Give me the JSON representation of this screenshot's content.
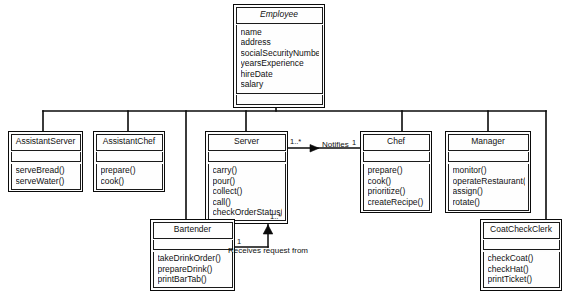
{
  "diagram": {
    "type": "uml-class-diagram",
    "colors": {
      "background": "#ffffff",
      "line": "#0a0a0a",
      "text": "#111111",
      "box_fill": "#fdfdfd"
    }
  },
  "classes": {
    "employee": {
      "name": "Employee",
      "abstract": true,
      "attributes": [
        "name",
        "address",
        "socialSecurityNumber",
        "yearsExperience",
        "hireDate",
        "salary"
      ],
      "methods": []
    },
    "assistant_server": {
      "name": "AssistantServer",
      "abstract": false,
      "attributes": [],
      "methods": [
        "serveBread()",
        "serveWater()"
      ]
    },
    "assistant_chef": {
      "name": "AssistantChef",
      "abstract": false,
      "attributes": [],
      "methods": [
        "prepare()",
        "cook()"
      ]
    },
    "server": {
      "name": "Server",
      "abstract": false,
      "attributes": [],
      "methods": [
        "carry()",
        "pour()",
        "collect()",
        "call()",
        "checkOrderStatus()"
      ]
    },
    "chef": {
      "name": "Chef",
      "abstract": false,
      "attributes": [],
      "methods": [
        "prepare()",
        "cook()",
        "prioritize()",
        "createRecipe()"
      ]
    },
    "manager": {
      "name": "Manager",
      "abstract": false,
      "attributes": [],
      "methods": [
        "monitor()",
        "operateRestaurant()",
        "assign()",
        "rotate()"
      ]
    },
    "bartender": {
      "name": "Bartender",
      "abstract": false,
      "attributes": [],
      "methods": [
        "takeDrinkOrder()",
        "prepareDrink()",
        "printBarTab()"
      ]
    },
    "coat_check_clerk": {
      "name": "CoatCheckClerk",
      "abstract": false,
      "attributes": [],
      "methods": [
        "checkCoat()",
        "checkHat()",
        "printTicket()"
      ]
    }
  },
  "associations": {
    "notifies": {
      "label": "Notifies",
      "source_multiplicity": "1..*",
      "target_multiplicity": "1"
    },
    "receives_request": {
      "label": "Receives request from",
      "source_multiplicity": "1",
      "target_multiplicity": "1..*"
    }
  },
  "generalization": {
    "parent": "Employee",
    "children": [
      "AssistantServer",
      "AssistantChef",
      "Server",
      "Bartender",
      "Chef",
      "Manager",
      "CoatCheckClerk"
    ]
  }
}
